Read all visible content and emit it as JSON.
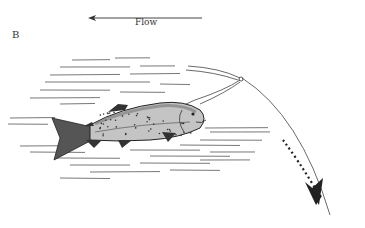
{
  "figure": {
    "panel_label": "B",
    "flow_label": "Flow",
    "flow_direction": "left",
    "colors": {
      "ink": "#222222",
      "water_lines": "#555555",
      "fish_body": "#bdbdbd",
      "fish_dark": "#333333",
      "background": "#ffffff"
    }
  }
}
